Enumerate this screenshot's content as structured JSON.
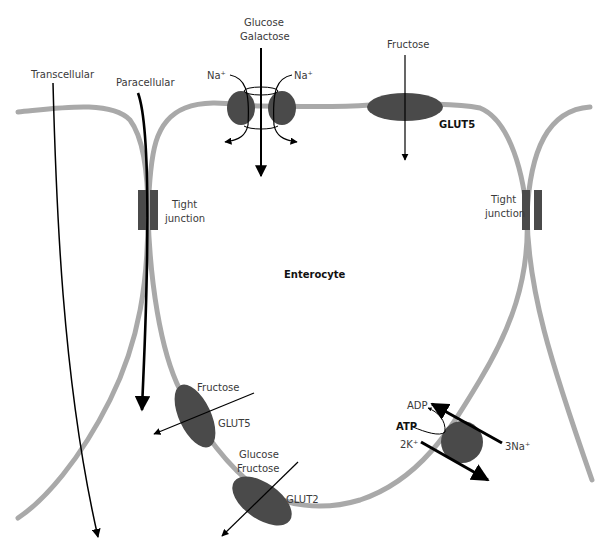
{
  "labels": {
    "transcellular": "Transcellular",
    "paracellular": "Paracellular",
    "glucose_top": "Glucose",
    "galactose_top": "Galactose",
    "na_left": "Na⁺",
    "na_right": "Na⁺",
    "fructose_top": "Fructose",
    "glut5_top": "GLUT5",
    "tight_junction_left_1": "Tight",
    "tight_junction_left_2": "junction",
    "tight_junction_right_1": "Tight",
    "tight_junction_right_2": "junction",
    "enterocyte": "Enterocyte",
    "fructose_bottom": "Fructose",
    "glut5_bottom": "GLUT5",
    "glucose_bottom": "Glucose",
    "fructose_bottom2": "Fructose",
    "glut2": "GLUT2",
    "adp": "ADP",
    "atp": "ATP",
    "k": "2K⁺",
    "na3": "3Na⁺"
  },
  "colors": {
    "membrane": "#a9a9a9",
    "protein": "#4a4a4a",
    "arrow": "#000000"
  }
}
